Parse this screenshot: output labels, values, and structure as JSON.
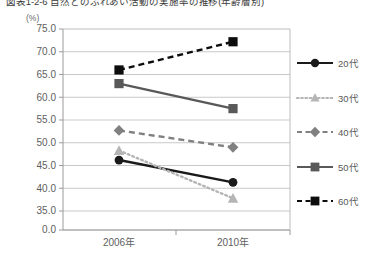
{
  "figure": {
    "title": "図表1-2-6 自然とのふれあい活動の実施率の推移(年齢層別)",
    "unit_label": "(%)"
  },
  "chart_data": {
    "type": "line",
    "title": "図表1-2-6 自然とのふれあい活動の実施率の推移(年齢層別)",
    "xlabel": "",
    "ylabel": "(%)",
    "categories": [
      "2006年",
      "2010年"
    ],
    "ylim": [
      35.0,
      75.0
    ],
    "yticks": [
      "75.0",
      "70.0",
      "65.0",
      "60.0",
      "55.0",
      "50.0",
      "45.0",
      "40.0",
      "35.0",
      "0.0"
    ],
    "ytick_values": [
      75.0,
      70.0,
      65.0,
      60.0,
      55.0,
      50.0,
      45.0,
      40.0,
      35.0,
      0.0
    ],
    "grid": true,
    "legend_position": "right",
    "axis_break": true,
    "series": [
      {
        "name": "20代",
        "values": [
          46.2,
          41.3
        ],
        "color": "#1a1a1a",
        "line_style": "solid",
        "marker": "circle"
      },
      {
        "name": "30代",
        "values": [
          48.3,
          37.8
        ],
        "color": "#b5b5b5",
        "line_style": "dotted",
        "marker": "triangle"
      },
      {
        "name": "40代",
        "values": [
          52.7,
          49.0
        ],
        "color": "#808080",
        "line_style": "dashed",
        "marker": "diamond"
      },
      {
        "name": "50代",
        "values": [
          63.0,
          57.5
        ],
        "color": "#595959",
        "line_style": "solid",
        "marker": "square"
      },
      {
        "name": "60代",
        "values": [
          66.0,
          72.2
        ],
        "color": "#0d0d0d",
        "line_style": "dashed",
        "marker": "square"
      }
    ]
  },
  "axis": {
    "y_ticks": [
      {
        "label": "75.0"
      },
      {
        "label": "70.0"
      },
      {
        "label": "65.0"
      },
      {
        "label": "60.0"
      },
      {
        "label": "55.0"
      },
      {
        "label": "50.0"
      },
      {
        "label": "45.0"
      },
      {
        "label": "40.0"
      },
      {
        "label": "35.0"
      },
      {
        "label": "0.0"
      }
    ],
    "x_ticks": [
      {
        "label": "2006年"
      },
      {
        "label": "2010年"
      }
    ]
  },
  "legend": {
    "items": [
      {
        "label": "20代"
      },
      {
        "label": "30代"
      },
      {
        "label": "40代"
      },
      {
        "label": "50代"
      },
      {
        "label": "60代"
      }
    ]
  }
}
